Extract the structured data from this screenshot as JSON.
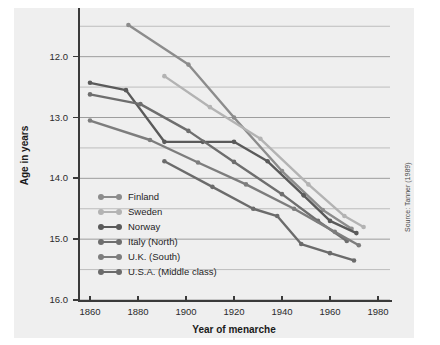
{
  "chart_data": {
    "type": "line",
    "title": "",
    "xlabel": "Year of menarche",
    "ylabel": "Age in years",
    "xlim": [
      1855,
      1985
    ],
    "ylim": [
      12.0,
      16.8
    ],
    "xticks": [
      1860,
      1880,
      1900,
      1920,
      1940,
      1960,
      1980
    ],
    "yticks": [
      12.0,
      13.0,
      14.0,
      15.0,
      16.0
    ],
    "grid": "horizontal major and minor (0.5) gridlines",
    "legend_position": "inside lower left",
    "source": "Source: Tanner (1989)",
    "series": [
      {
        "name": "Finland",
        "color": "#8c8c8c",
        "x": [
          1876,
          1901,
          1920,
          1940,
          1957,
          1969
        ],
        "y": [
          16.52,
          15.87,
          15.0,
          14.12,
          13.48,
          13.17
        ]
      },
      {
        "name": "Sweden",
        "color": "#b3b3b3",
        "x": [
          1891,
          1910,
          1931,
          1951,
          1966,
          1974
        ],
        "y": [
          15.68,
          15.17,
          14.65,
          13.9,
          13.38,
          13.2
        ]
      },
      {
        "name": "Norway",
        "color": "#5a5a5a",
        "x": [
          1860,
          1875,
          1891,
          1907,
          1920,
          1934,
          1949,
          1960,
          1971
        ],
        "y": [
          15.57,
          15.45,
          14.6,
          14.6,
          14.6,
          14.28,
          13.72,
          13.3,
          13.1
        ]
      },
      {
        "name": "Italy (North)",
        "color": "#6e6e6e",
        "x": [
          1860,
          1881,
          1901,
          1920,
          1940,
          1955,
          1967
        ],
        "y": [
          15.38,
          15.22,
          14.78,
          14.27,
          13.74,
          13.3,
          12.97
        ]
      },
      {
        "name": "U.K. (South)",
        "color": "#7d7d7d",
        "x": [
          1860,
          1885,
          1905,
          1925,
          1945,
          1962,
          1972
        ],
        "y": [
          14.95,
          14.63,
          14.26,
          13.9,
          13.5,
          13.12,
          12.9
        ]
      },
      {
        "name": "U.S.A. (Middle class)",
        "color": "#6b6b6b",
        "x": [
          1891,
          1911,
          1928,
          1938,
          1948,
          1960,
          1970
        ],
        "y": [
          14.28,
          13.86,
          13.5,
          13.38,
          12.92,
          12.77,
          12.65
        ]
      }
    ]
  },
  "axis": {
    "x_title": "Year of menarche",
    "y_title": "Age in years",
    "x_tick_labels": [
      "1860",
      "1880",
      "1900",
      "1920",
      "1940",
      "1960",
      "1980"
    ],
    "y_tick_labels": [
      "16.0",
      "15.0",
      "14.0",
      "13.0",
      "12.0"
    ]
  },
  "legend": {
    "items": [
      {
        "label": "Finland"
      },
      {
        "label": "Sweden"
      },
      {
        "label": "Norway"
      },
      {
        "label": "Italy (North)"
      },
      {
        "label": "U.K. (South)"
      },
      {
        "label": "U.S.A. (Middle class)"
      }
    ]
  },
  "source": {
    "text": "Source: Tanner (1989)"
  }
}
